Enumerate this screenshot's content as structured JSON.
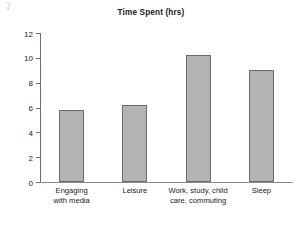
{
  "figure": {
    "artifact_mark": "ʔ",
    "background": "#ffffff"
  },
  "chart_data": {
    "type": "bar",
    "title": "Time Spent (hrs)",
    "xlabel": "",
    "ylabel": "",
    "categories": [
      "Engaging\nwith media",
      "Leisure",
      "Work, study, child\ncare, commuting",
      "Sleep"
    ],
    "values": [
      5.8,
      6.2,
      10.2,
      9.0
    ],
    "ylim": [
      0,
      12
    ],
    "yticks": [
      0,
      2,
      4,
      6,
      8,
      10,
      12
    ],
    "ytick_labels": [
      "0",
      "2",
      "4",
      "6",
      "8",
      "10",
      "12"
    ],
    "grid": false,
    "legend": null,
    "bar_color": "#b3b3b3",
    "bar_edge_color": "#6b6b6b",
    "axis_color": "#6e6e6e",
    "text_color": "#1a1a1a"
  }
}
